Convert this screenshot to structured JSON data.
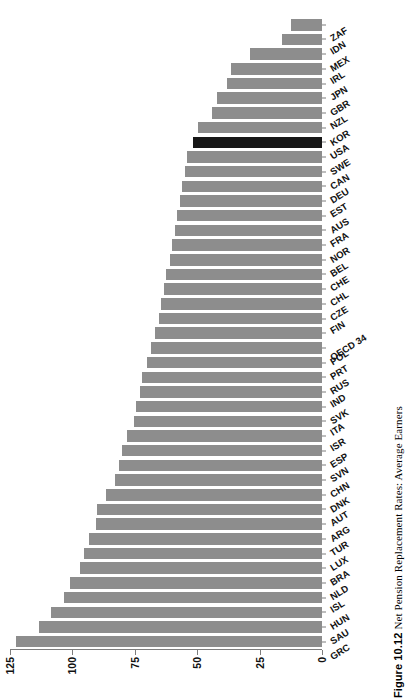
{
  "figure": {
    "number": "Figure 10.12",
    "caption": "Net Pension Replacement Rates: Average Earners"
  },
  "colors": {
    "bar": "#8d8d8d",
    "bar_highlight": "#171717",
    "axis": "#7d7d7d",
    "background": "#ffffff"
  },
  "highlight": "USA",
  "chart_data": {
    "type": "bar",
    "orientation": "horizontal",
    "title": "Net Pension Replacement Rates: Average Earners",
    "xlabel": "",
    "ylabel": "",
    "ylim": [
      0,
      125
    ],
    "yticks": [
      0,
      25,
      50,
      75,
      100,
      125
    ],
    "grid": false,
    "legend": null,
    "highlight_category": "USA",
    "categories": [
      "GRC",
      "SAU",
      "HUN",
      "ISL",
      "NLD",
      "BRA",
      "LUX",
      "TUR",
      "ARG",
      "AUT",
      "DNK",
      "CHN",
      "SVN",
      "ESP",
      "ISR",
      "ITA",
      "SVK",
      "IND",
      "RUS",
      "PRT",
      "POL",
      "OECD 34",
      "FIN",
      "CZE",
      "CHL",
      "CHE",
      "BEL",
      "NOR",
      "FRA",
      "AUS",
      "EST",
      "DEU",
      "CAN",
      "SWE",
      "USA",
      "KOR",
      "NZL",
      "GBR",
      "JPN",
      "IRL",
      "MEX",
      "IDN",
      "ZAF"
    ],
    "values": [
      122.5,
      113.5,
      108.5,
      103.5,
      101.0,
      97.0,
      95.5,
      93.5,
      90.5,
      90.0,
      86.5,
      83.0,
      81.5,
      80.0,
      78.0,
      75.5,
      74.5,
      73.0,
      72.0,
      70.0,
      68.5,
      67.0,
      65.5,
      64.5,
      63.5,
      62.5,
      61.0,
      60.0,
      59.0,
      58.0,
      57.0,
      56.0,
      55.0,
      54.0,
      51.5,
      49.5,
      44.0,
      42.0,
      38.0,
      36.5,
      29.0,
      16.0,
      12.5
    ]
  }
}
